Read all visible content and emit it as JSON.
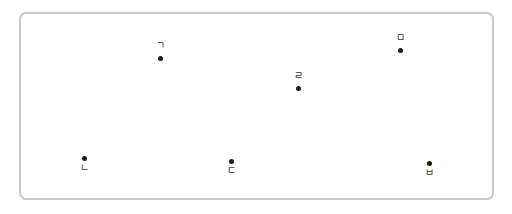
{
  "diagram": {
    "type": "labeled-point-layout",
    "frame": {
      "left": 19,
      "top": 12,
      "right": 494,
      "bottom": 200,
      "border_color": "#c8c8c8"
    },
    "points": [
      {
        "id": "p1",
        "label": "ㄱ",
        "x": 160,
        "y": 58,
        "label_position": "above"
      },
      {
        "id": "p2",
        "label": "ㄴ",
        "x": 84,
        "y": 158,
        "label_position": "below"
      },
      {
        "id": "p3",
        "label": "ㄷ",
        "x": 231,
        "y": 161,
        "label_position": "below"
      },
      {
        "id": "p4",
        "label": "ㄹ",
        "x": 298,
        "y": 88,
        "label_position": "above"
      },
      {
        "id": "p5",
        "label": "ㅁ",
        "x": 400,
        "y": 50,
        "label_position": "above"
      },
      {
        "id": "p6",
        "label": "ㅂ",
        "x": 429,
        "y": 163,
        "label_position": "below"
      }
    ]
  }
}
